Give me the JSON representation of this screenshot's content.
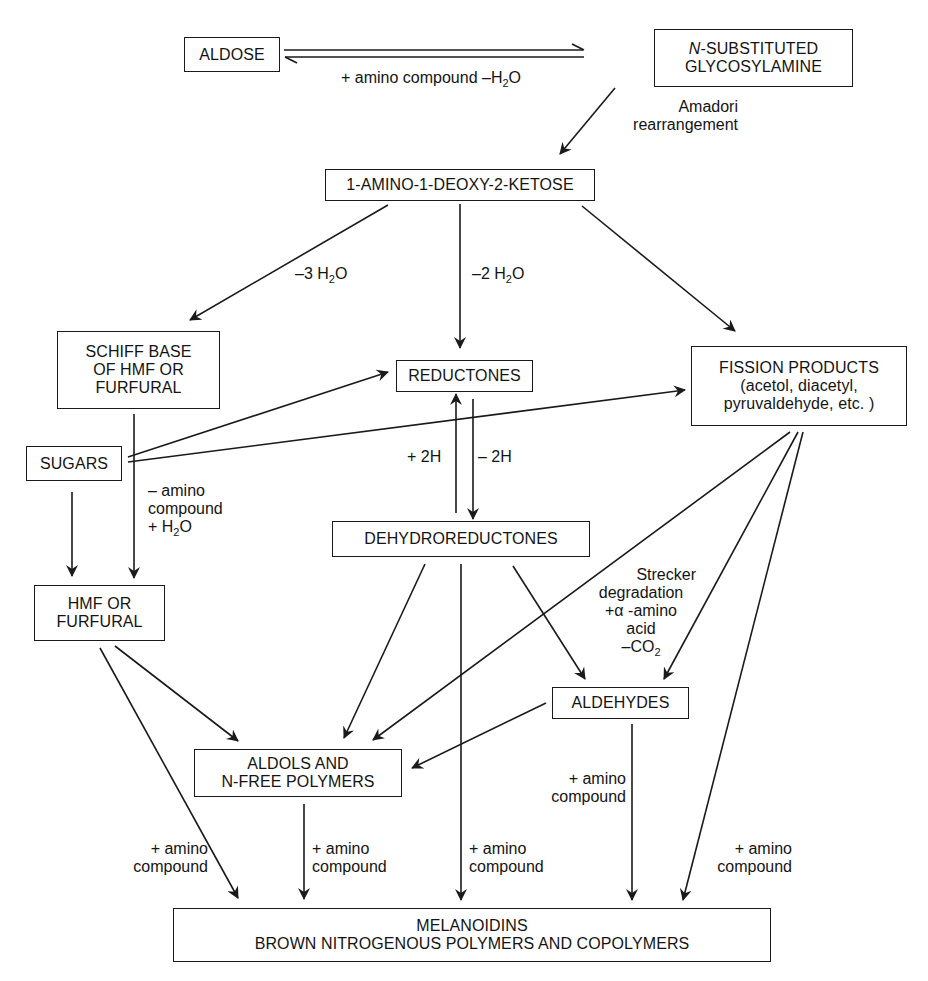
{
  "diagram": {
    "nodes": {
      "aldose": {
        "lines": [
          "ALDOSE"
        ]
      },
      "glycosylamine": {
        "lines": [
          "N",
          "-SUBSTITUTED",
          "GLYCOSYLAMINE"
        ]
      },
      "ketose": {
        "lines": [
          "1-AMINO-1-DEOXY-2-KETOSE"
        ]
      },
      "schiff_base": {
        "lines": [
          "SCHIFF BASE",
          "OF HMF OR",
          "FURFURAL"
        ]
      },
      "reductones": {
        "lines": [
          "REDUCTONES"
        ]
      },
      "fission": {
        "lines": [
          "FISSION PRODUCTS",
          "(acetol, diacetyl,",
          "pyruvaldehyde, etc. )"
        ]
      },
      "sugars": {
        "lines": [
          "SUGARS"
        ]
      },
      "dehydroreductones": {
        "lines": [
          "DEHYDROREDUCTONES"
        ]
      },
      "hmf": {
        "lines": [
          "HMF OR",
          "FURFURAL"
        ]
      },
      "aldehydes": {
        "lines": [
          "ALDEHYDES"
        ]
      },
      "aldols": {
        "lines": [
          "ALDOLS AND",
          "N-FREE POLYMERS"
        ]
      },
      "melanoidins": {
        "lines": [
          "MELANOIDINS",
          "BROWN NITROGENOUS POLYMERS AND COPOLYMERS"
        ]
      }
    },
    "edge_labels": {
      "aldose_glycosylamine": {
        "text": "+ amino compound –H",
        "sub": "2",
        "tail": "O"
      },
      "amadori": {
        "lines": [
          "Amadori",
          "rearrangement"
        ]
      },
      "minus3h2o": {
        "text": "–3 H",
        "sub": "2",
        "tail": "O"
      },
      "minus2h2o": {
        "text": "–2 H",
        "sub": "2",
        "tail": "O"
      },
      "plus2h": {
        "text": "+ 2H"
      },
      "minus2h": {
        "text": "– 2H"
      },
      "schiff_to_hmf": {
        "lines": [
          "– amino",
          "compound"
        ],
        "last": "+ H",
        "sub": "2",
        "tail": "O"
      },
      "strecker": {
        "lines": [
          "Strecker",
          "degradation",
          "+α -amino",
          "acid"
        ],
        "last": "–CO",
        "sub": "2"
      },
      "amino_hmf": {
        "lines": [
          "+ amino",
          "compound"
        ]
      },
      "amino_aldols": {
        "lines": [
          "+ amino",
          "compound"
        ]
      },
      "amino_dehydro": {
        "lines": [
          "+ amino",
          "compound"
        ]
      },
      "amino_aldehydes": {
        "lines": [
          "+ amino",
          "compound"
        ]
      },
      "amino_fission": {
        "lines": [
          "+ amino",
          "compound"
        ]
      }
    },
    "stroke_color": "#1a1a1a",
    "background_color": "#ffffff"
  }
}
